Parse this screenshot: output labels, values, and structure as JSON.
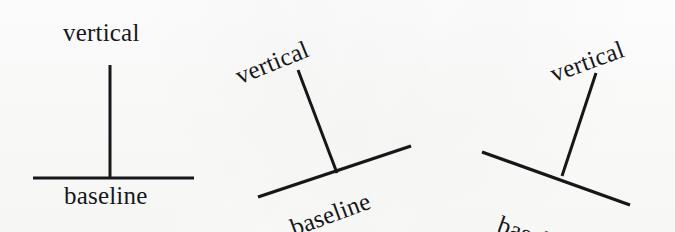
{
  "canvas": {
    "width": 675,
    "height": 232,
    "background_color": "#fdfdfc",
    "ink_color": "#17171a"
  },
  "figures": [
    {
      "id": "figure-upright",
      "name": "upright-baseline-vertical",
      "rotation_degrees": 0,
      "vertical_label": "vertical",
      "baseline_label": "baseline",
      "vertical_line": {
        "x1": 110,
        "y1": 65,
        "x2": 110,
        "y2": 178
      },
      "baseline_line": {
        "x1": 33,
        "y1": 178,
        "x2": 194,
        "y2": 178
      },
      "stroke_width": 3
    },
    {
      "id": "figure-tilted-left",
      "name": "tilted-baseline-vertical",
      "rotation_degrees": -20,
      "vertical_label": "vertical",
      "baseline_label": "baseline",
      "vertical_line": {
        "x1": 298,
        "y1": 70,
        "x2": 337,
        "y2": 173
      },
      "baseline_line": {
        "x1": 258,
        "y1": 197,
        "x2": 411,
        "y2": 146
      },
      "stroke_width": 3
    },
    {
      "id": "figure-tilted-right",
      "name": "tilted-baseline-vertical-mirrored",
      "rotation_degrees": 20,
      "vertical_label": "vertical",
      "baseline_label": "baseline",
      "vertical_line": {
        "x1": 596,
        "y1": 73,
        "x2": 562,
        "y2": 176
      },
      "baseline_line": {
        "x1": 482,
        "y1": 152,
        "x2": 630,
        "y2": 205
      },
      "stroke_width": 3
    }
  ]
}
